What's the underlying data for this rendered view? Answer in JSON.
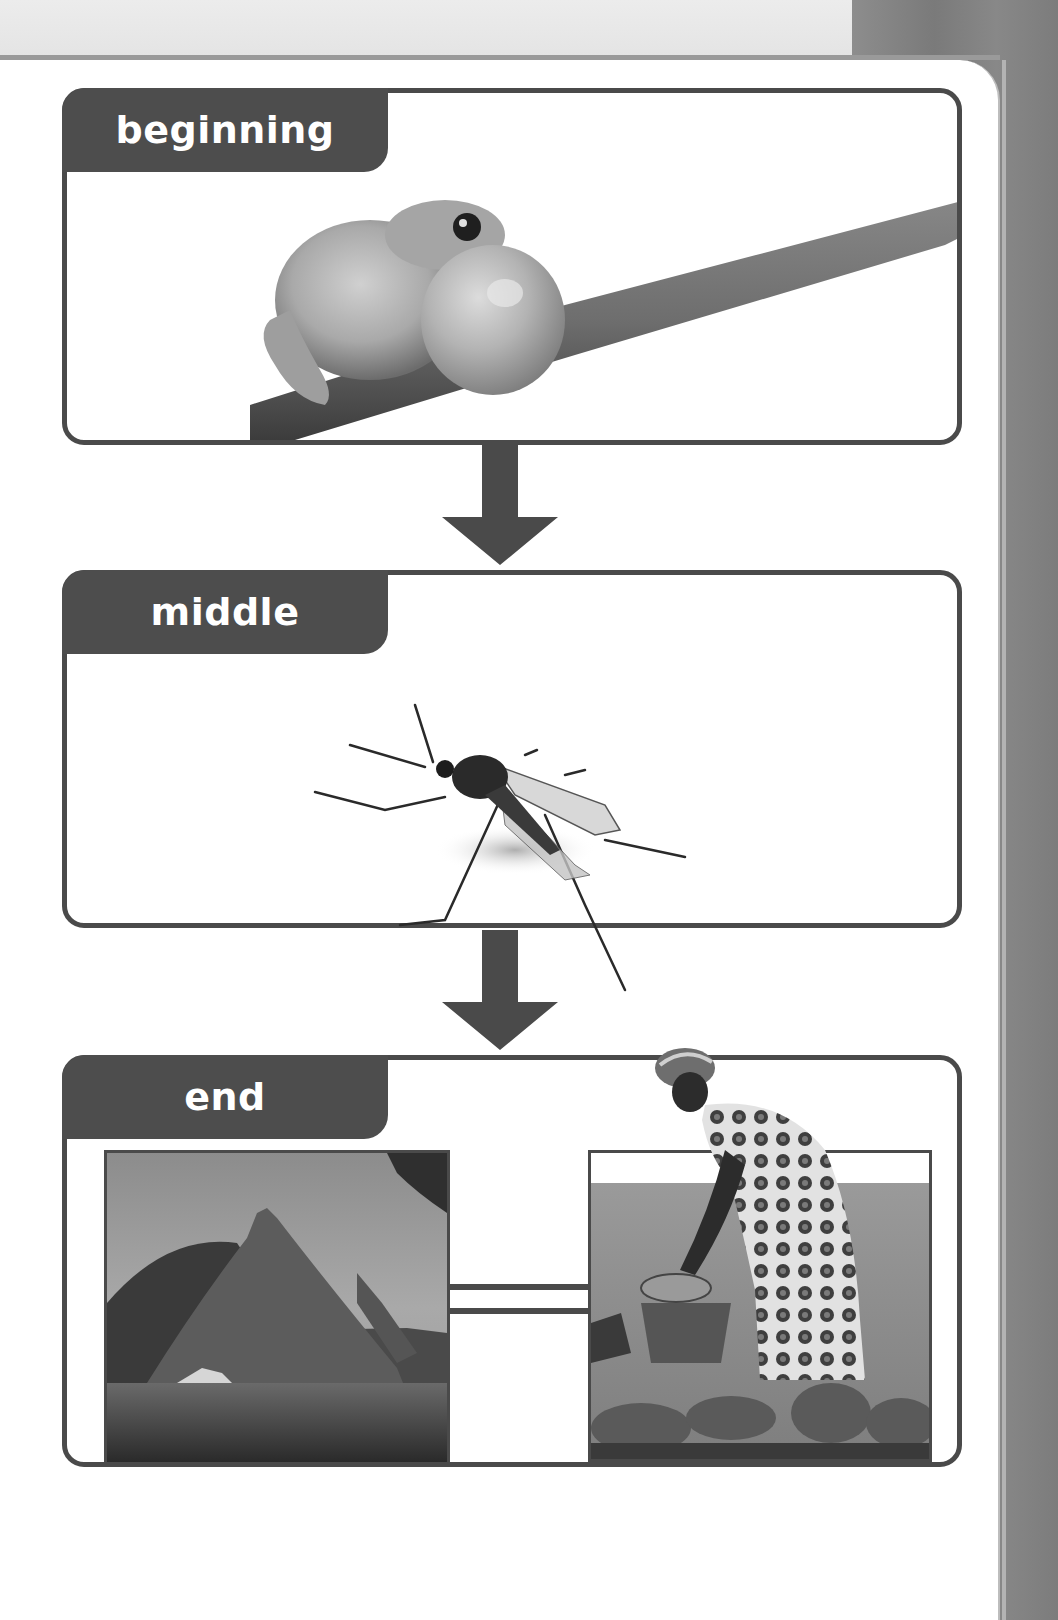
{
  "panels": [
    {
      "label": "beginning",
      "image": "tree-frog-with-inflated-vocal-sac-on-branch"
    },
    {
      "label": "middle",
      "image": "mosquito"
    },
    {
      "label": "end",
      "images": [
        "thatched-grass-huts",
        "woman-washing-in-water-with-basins"
      ]
    }
  ],
  "arrows": [
    {
      "icon": "arrow-down-icon"
    },
    {
      "icon": "arrow-down-icon"
    }
  ],
  "colors": {
    "panel_border": "#4a4a4a",
    "tab_fill": "#4d4d4d",
    "tab_text": "#ffffff",
    "arrow_fill": "#4a4a4a",
    "background": "#ffffff",
    "side_strip": "#808080"
  }
}
